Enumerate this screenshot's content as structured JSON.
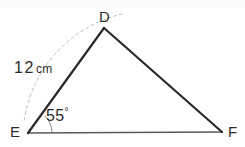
{
  "figure": {
    "kind": "triangle-geometry-diagram",
    "background_color": "#ffffff",
    "stroke_color": "#2a2a2a",
    "base_stroke_color": "#555555",
    "construction_color": "#b9b9b9",
    "vertices": {
      "D": {
        "label": "D",
        "x": 104,
        "y": 28
      },
      "E": {
        "label": "E",
        "x": 28,
        "y": 133
      },
      "F": {
        "label": "F",
        "x": 222,
        "y": 132
      }
    },
    "labels": {
      "vertex_d": "D",
      "vertex_e": "E",
      "vertex_f": "F",
      "side_length_number": "12",
      "side_length_unit": "cm",
      "angle_value": "55",
      "angle_symbol": "°"
    },
    "measurements": {
      "side_DE": "12 cm",
      "angle_E": "55°"
    }
  }
}
